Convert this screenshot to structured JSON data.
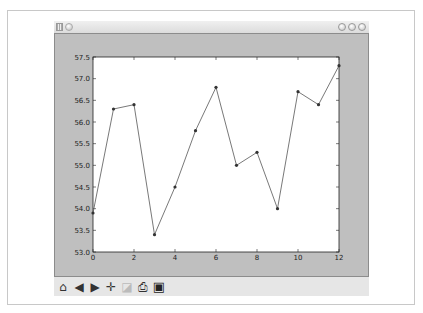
{
  "window": {
    "title": "",
    "controls": [
      "minimize",
      "maximize",
      "close"
    ]
  },
  "toolbar": {
    "buttons": [
      {
        "name": "home",
        "icon": "home-icon",
        "glyph": "⌂"
      },
      {
        "name": "back",
        "icon": "back-arrow-icon",
        "glyph": "◀"
      },
      {
        "name": "forward",
        "icon": "forward-arrow-icon",
        "glyph": "▶"
      },
      {
        "name": "pan",
        "icon": "pan-move-icon",
        "glyph": "✛"
      },
      {
        "name": "zoom",
        "icon": "zoom-rect-icon",
        "glyph": "◪"
      },
      {
        "name": "configure",
        "icon": "configure-subplots-icon",
        "glyph": "⎙"
      },
      {
        "name": "save",
        "icon": "save-floppy-icon",
        "glyph": "▣"
      }
    ]
  },
  "chart_data": {
    "type": "line",
    "title": "",
    "xlabel": "",
    "ylabel": "",
    "x": [
      0,
      1,
      2,
      3,
      4,
      5,
      6,
      7,
      8,
      9,
      10,
      11,
      12
    ],
    "series": [
      {
        "name": "series",
        "values": [
          53.9,
          56.3,
          56.4,
          53.4,
          54.5,
          55.8,
          56.8,
          55.0,
          55.3,
          54.0,
          56.7,
          56.4,
          57.3
        ],
        "color": "#555555",
        "marker": "o"
      }
    ],
    "xlim": [
      0,
      12
    ],
    "ylim": [
      53.0,
      57.5
    ],
    "xticks": [
      "0",
      "2",
      "4",
      "6",
      "8",
      "10",
      "12"
    ],
    "yticks": [
      "53.0",
      "53.5",
      "54.0",
      "54.5",
      "55.0",
      "55.5",
      "56.0",
      "56.5",
      "57.0",
      "57.5"
    ],
    "grid": false,
    "legend": null
  }
}
